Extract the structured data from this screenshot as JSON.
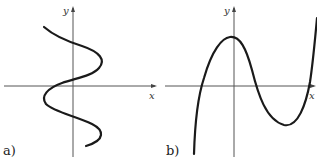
{
  "figure": {
    "panels": [
      {
        "id": "a",
        "label": "a)",
        "x_axis_label": "x",
        "y_axis_label": "y",
        "description": "Curve that is not a function of x (S-shaped, winding back and forth across the y-axis, fails vertical line test)",
        "curve_points_px": [
          [
            44,
            27
          ],
          [
            52,
            33
          ],
          [
            64,
            40
          ],
          [
            76,
            45
          ],
          [
            90,
            50
          ],
          [
            100,
            55
          ],
          [
            103,
            62
          ],
          [
            98,
            70
          ],
          [
            86,
            76
          ],
          [
            74,
            79
          ],
          [
            62,
            84
          ],
          [
            50,
            89
          ],
          [
            44,
            95
          ],
          [
            45,
            103
          ],
          [
            55,
            110
          ],
          [
            73,
            116
          ],
          [
            90,
            123
          ],
          [
            101,
            130
          ],
          [
            103,
            138
          ],
          [
            96,
            143
          ],
          [
            86,
            146
          ]
        ]
      },
      {
        "id": "b",
        "label": "b)",
        "x_axis_label": "x",
        "y_axis_label": "y",
        "description": "Cubic-like function: rises from bottom left, local maximum near y-axis, local minimum right of origin, rises steeply to top right",
        "curve_points_px": [
          [
            194,
            154
          ],
          [
            195,
            130
          ],
          [
            198,
            105
          ],
          [
            202,
            86
          ],
          [
            210,
            60
          ],
          [
            219,
            45
          ],
          [
            227,
            38
          ],
          [
            233,
            37
          ],
          [
            240,
            42
          ],
          [
            246,
            52
          ],
          [
            251,
            68
          ],
          [
            256,
            86
          ],
          [
            262,
            102
          ],
          [
            270,
            115
          ],
          [
            278,
            123
          ],
          [
            287,
            124
          ],
          [
            296,
            117
          ],
          [
            303,
            102
          ],
          [
            308,
            86
          ],
          [
            313,
            60
          ],
          [
            316,
            38
          ],
          [
            317,
            20
          ]
        ]
      }
    ],
    "colors": {
      "curve": "#1a1a1a",
      "axis": "#555555",
      "background": "#ffffff"
    }
  }
}
